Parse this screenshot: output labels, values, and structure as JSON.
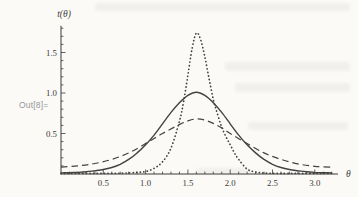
{
  "out_label": "Out[8]=",
  "colors": {
    "background": "#fbfaf7",
    "axis": "#3a3a3a",
    "tick_label": "#3b3b3b",
    "out_label": "#979797",
    "curve": "#424242"
  },
  "chart_data": {
    "type": "line",
    "title": "",
    "xlabel": "θ",
    "ylabel": "t(θ)",
    "xlim": [
      0,
      3.27
    ],
    "ylim": [
      0,
      1.83
    ],
    "grid": false,
    "legend": false,
    "x_ticks": [
      0.5,
      1.0,
      1.5,
      2.0,
      2.5,
      3.0
    ],
    "x_tick_labels": [
      "0.5",
      "1.0",
      "1.5",
      "2.0",
      "2.5",
      "3.0"
    ],
    "y_ticks": [
      0.5,
      1.0,
      1.5
    ],
    "y_tick_labels": [
      "0.5",
      "1.0",
      "1.5"
    ],
    "minor_tick_step": 0.1,
    "series": [
      {
        "name": "dashed-broad-curve",
        "style": "dashed",
        "peak": {
          "x": 1.6,
          "y": 0.68
        },
        "points": [
          [
            0.0,
            0.085
          ],
          [
            0.2,
            0.1
          ],
          [
            0.4,
            0.13
          ],
          [
            0.6,
            0.18
          ],
          [
            0.8,
            0.26
          ],
          [
            1.0,
            0.375
          ],
          [
            1.2,
            0.5
          ],
          [
            1.4,
            0.61
          ],
          [
            1.5,
            0.655
          ],
          [
            1.6,
            0.68
          ],
          [
            1.7,
            0.665
          ],
          [
            1.8,
            0.625
          ],
          [
            1.9,
            0.57
          ],
          [
            2.0,
            0.5
          ],
          [
            2.2,
            0.375
          ],
          [
            2.4,
            0.26
          ],
          [
            2.6,
            0.18
          ],
          [
            2.8,
            0.125
          ],
          [
            3.0,
            0.095
          ],
          [
            3.2,
            0.085
          ]
        ]
      },
      {
        "name": "solid-medium-curve",
        "style": "solid",
        "peak": {
          "x": 1.6,
          "y": 1.01
        },
        "points": [
          [
            0.0,
            0.014
          ],
          [
            0.1,
            0.016
          ],
          [
            0.2,
            0.02
          ],
          [
            0.3,
            0.028
          ],
          [
            0.4,
            0.04
          ],
          [
            0.5,
            0.055
          ],
          [
            0.6,
            0.08
          ],
          [
            0.7,
            0.12
          ],
          [
            0.8,
            0.18
          ],
          [
            0.9,
            0.26
          ],
          [
            1.0,
            0.36
          ],
          [
            1.1,
            0.48
          ],
          [
            1.2,
            0.62
          ],
          [
            1.3,
            0.76
          ],
          [
            1.4,
            0.88
          ],
          [
            1.5,
            0.97
          ],
          [
            1.6,
            1.01
          ],
          [
            1.7,
            0.97
          ],
          [
            1.8,
            0.88
          ],
          [
            1.9,
            0.76
          ],
          [
            2.0,
            0.62
          ],
          [
            2.1,
            0.48
          ],
          [
            2.2,
            0.36
          ],
          [
            2.3,
            0.26
          ],
          [
            2.4,
            0.18
          ],
          [
            2.5,
            0.12
          ],
          [
            2.6,
            0.08
          ],
          [
            2.7,
            0.055
          ],
          [
            2.8,
            0.04
          ],
          [
            2.9,
            0.028
          ],
          [
            3.0,
            0.02
          ],
          [
            3.1,
            0.016
          ],
          [
            3.2,
            0.014
          ]
        ]
      },
      {
        "name": "dotted-narrow-curve",
        "style": "dotted",
        "peak": {
          "x": 1.6,
          "y": 1.74
        },
        "points": [
          [
            0.0,
            0.008
          ],
          [
            0.4,
            0.008
          ],
          [
            0.7,
            0.01
          ],
          [
            0.9,
            0.02
          ],
          [
            1.0,
            0.03
          ],
          [
            1.1,
            0.07
          ],
          [
            1.2,
            0.15
          ],
          [
            1.3,
            0.32
          ],
          [
            1.4,
            0.65
          ],
          [
            1.45,
            0.9
          ],
          [
            1.5,
            1.22
          ],
          [
            1.55,
            1.55
          ],
          [
            1.6,
            1.74
          ],
          [
            1.65,
            1.66
          ],
          [
            1.7,
            1.45
          ],
          [
            1.75,
            1.18
          ],
          [
            1.8,
            0.92
          ],
          [
            1.85,
            0.74
          ],
          [
            1.9,
            0.58
          ],
          [
            1.95,
            0.46
          ],
          [
            2.0,
            0.36
          ],
          [
            2.05,
            0.26
          ],
          [
            2.1,
            0.18
          ],
          [
            2.2,
            0.06
          ],
          [
            2.3,
            0.025
          ],
          [
            2.4,
            0.012
          ],
          [
            2.6,
            0.008
          ],
          [
            3.0,
            0.008
          ],
          [
            3.2,
            0.008
          ]
        ]
      }
    ]
  }
}
